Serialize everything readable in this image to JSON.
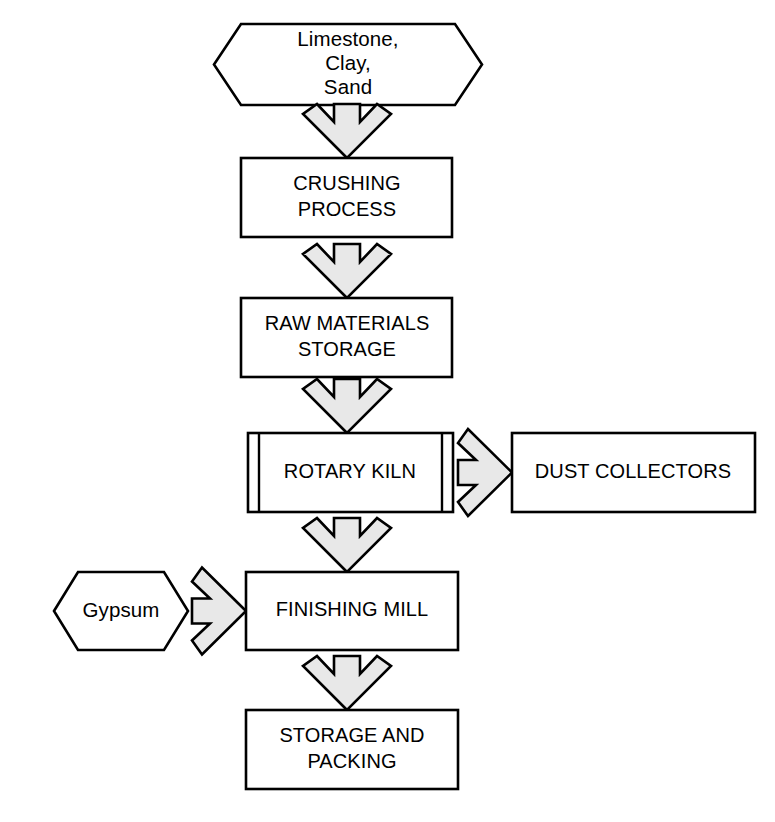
{
  "diagram": {
    "type": "flowchart",
    "background_color": "#ffffff",
    "shape_fill_color": "#ffffff",
    "shape_stroke_color": "#000000",
    "arrow_fill_color": "#e8e8e8",
    "arrow_stroke_color": "#000000"
  },
  "nodes": {
    "raw_materials": {
      "label_line1": "Limestone,",
      "label_line2": "Clay,",
      "label_line3": "Sand",
      "shape": "hexagon"
    },
    "crushing": {
      "label_line1": "CRUSHING",
      "label_line2": "PROCESS",
      "shape": "rectangle"
    },
    "raw_storage": {
      "label_line1": "RAW MATERIALS",
      "label_line2": "STORAGE",
      "shape": "rectangle"
    },
    "rotary_kiln": {
      "label_line1": "ROTARY KILN",
      "shape": "predefined-process"
    },
    "dust_collectors": {
      "label_line1": "DUST COLLECTORS",
      "shape": "rectangle"
    },
    "gypsum": {
      "label_line1": "Gypsum",
      "shape": "hexagon"
    },
    "finishing_mill": {
      "label_line1": "FINISHING MILL",
      "shape": "rectangle"
    },
    "storage_packing": {
      "label_line1": "STORAGE AND",
      "label_line2": "PACKING",
      "shape": "rectangle"
    }
  },
  "connectors": [
    {
      "id": "arrow-raw-to-crushing",
      "from": "raw_materials",
      "to": "crushing",
      "direction": "down"
    },
    {
      "id": "arrow-crushing-to-storage",
      "from": "crushing",
      "to": "raw_storage",
      "direction": "down"
    },
    {
      "id": "arrow-storage-to-kiln",
      "from": "raw_storage",
      "to": "rotary_kiln",
      "direction": "down"
    },
    {
      "id": "arrow-kiln-to-dust",
      "from": "rotary_kiln",
      "to": "dust_collectors",
      "direction": "right"
    },
    {
      "id": "arrow-kiln-to-mill",
      "from": "rotary_kiln",
      "to": "finishing_mill",
      "direction": "down"
    },
    {
      "id": "arrow-gypsum-to-mill",
      "from": "gypsum",
      "to": "finishing_mill",
      "direction": "right"
    },
    {
      "id": "arrow-mill-to-packing",
      "from": "finishing_mill",
      "to": "storage_packing",
      "direction": "down"
    }
  ]
}
